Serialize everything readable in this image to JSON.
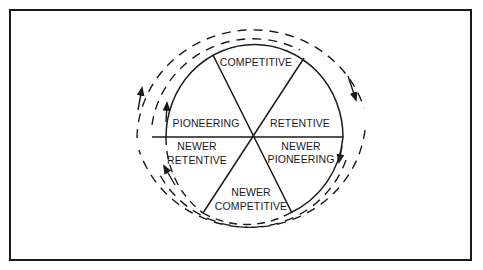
{
  "diagram": {
    "type": "cycle-wheel",
    "frame": true,
    "segments": [
      {
        "id": "competitive",
        "lines": [
          "COMPETITIVE"
        ]
      },
      {
        "id": "retentive",
        "lines": [
          "RETENTIVE"
        ]
      },
      {
        "id": "newer-pioneering",
        "lines": [
          "NEWER",
          "PIONEERING"
        ]
      },
      {
        "id": "newer-competitive",
        "lines": [
          "NEWER",
          "COMPETITIVE"
        ]
      },
      {
        "id": "newer-retentive",
        "lines": [
          "NEWER",
          "RETENTIVE"
        ]
      },
      {
        "id": "pioneering",
        "lines": [
          "PIONEERING"
        ]
      }
    ],
    "flow_direction": "clockwise",
    "colors": {
      "ink": "#1a1a1a",
      "background": "#ffffff"
    }
  }
}
